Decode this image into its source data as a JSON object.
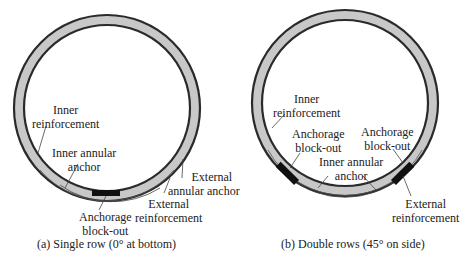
{
  "panels": [
    {
      "caption": "(a) Single row (0° at bottom)",
      "labels": {
        "inner_reinforcement_1": "Inner",
        "inner_reinforcement_2": "reinforcement",
        "inner_annular_anchor_1": "Inner annular",
        "inner_annular_anchor_2": "anchor",
        "external_annular_anchor_1": "External",
        "external_annular_anchor_2": "annular anchor",
        "external_reinforcement_1": "External",
        "external_reinforcement_2": "reinforcement",
        "anchorage_blockout_1": "Anchorage",
        "anchorage_blockout_2": "block-out"
      }
    },
    {
      "caption": "(b) Double rows (45° on side)",
      "labels": {
        "inner_reinforcement_1": "Inner",
        "inner_reinforcement_2": "reinforcement",
        "anchorage_blockout_left_1": "Anchorage",
        "anchorage_blockout_left_2": "block-out",
        "anchorage_blockout_right_1": "Anchorage",
        "anchorage_blockout_right_2": "block-out",
        "inner_annular_anchor_1": "Inner annular",
        "inner_annular_anchor_2": "anchor",
        "external_reinforcement_1": "External",
        "external_reinforcement_2": "reinforcement"
      }
    }
  ],
  "colors": {
    "ring_fill": "#c8c8c8",
    "ring_stroke": "#2a2a2a",
    "blockout": "#111111"
  }
}
